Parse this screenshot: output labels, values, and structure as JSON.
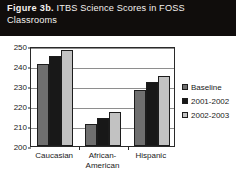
{
  "figure": {
    "label": "Figure 3b.",
    "caption": "ITBS Science Scores in FOSS Classrooms",
    "banner_color": "#100d0c",
    "banner_text_color": "#f4f1ee"
  },
  "chart_data": {
    "type": "bar",
    "title": "ITBS Science Scores in FOSS Classrooms",
    "xlabel": "",
    "ylabel": "",
    "ylim": [
      200,
      250
    ],
    "yticks": [
      200,
      210,
      220,
      230,
      240,
      250
    ],
    "ytick_labels": [
      "200",
      "210",
      "220",
      "230",
      "240",
      "250"
    ],
    "grid": true,
    "legend_position": "right",
    "categories": [
      "Caucasian",
      "African-American",
      "Hispanic"
    ],
    "category_lines": [
      [
        "Caucasian"
      ],
      [
        "African-",
        "American"
      ],
      [
        "Hispanic"
      ]
    ],
    "series": [
      {
        "name": "Baseline",
        "color": "#6f6f6f",
        "values": [
          241,
          211,
          228
        ]
      },
      {
        "name": "2001-2002",
        "color": "#181818",
        "values": [
          245,
          214,
          232
        ]
      },
      {
        "name": "2002-2003",
        "color": "#c2c2c2",
        "values": [
          248,
          217,
          235
        ]
      }
    ]
  }
}
